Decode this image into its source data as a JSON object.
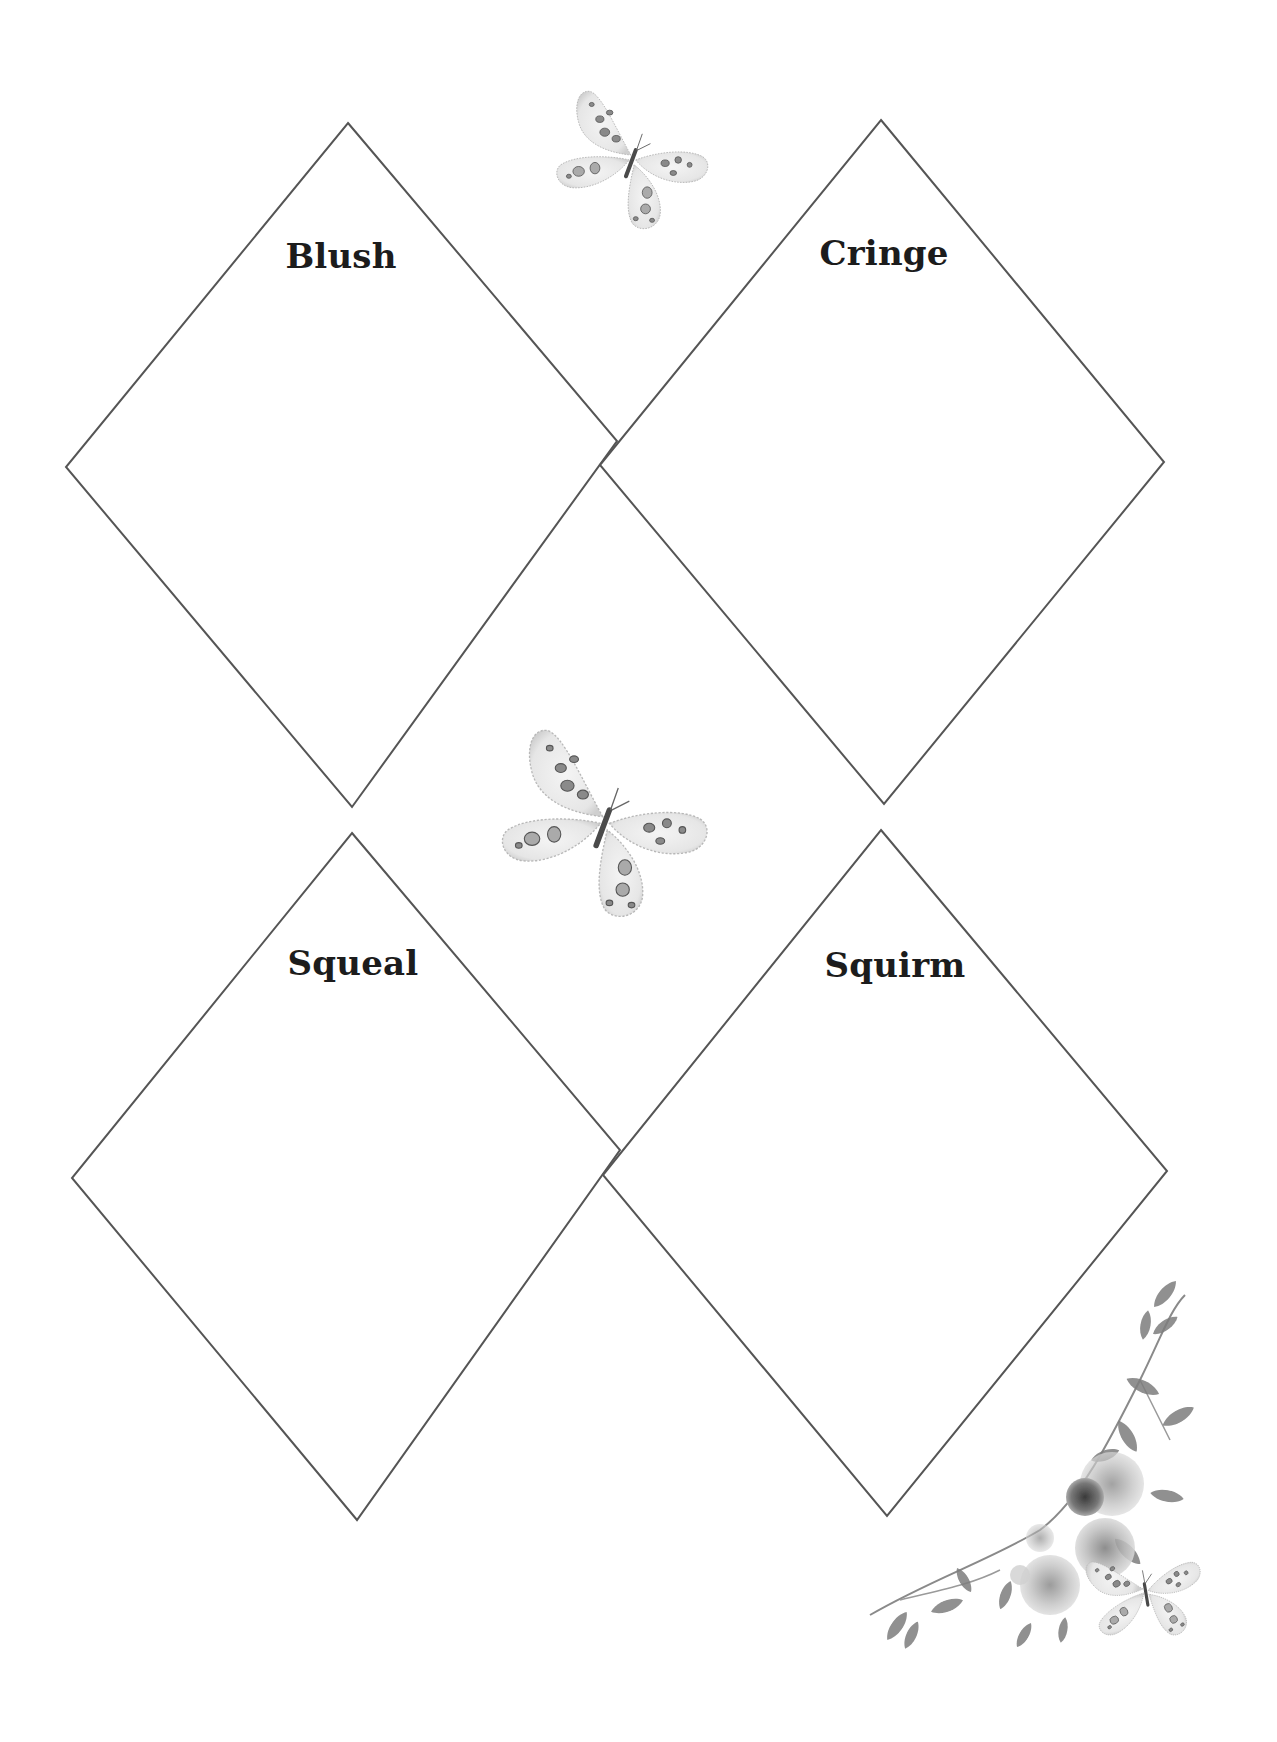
{
  "page": {
    "background": "#ffffff",
    "line_color": "#555555"
  },
  "diamonds": [
    {
      "label": "Blush",
      "top": [
        348,
        123
      ],
      "right": [
        617,
        441
      ],
      "bottom": [
        352,
        807
      ],
      "left": [
        66,
        467
      ],
      "label_pos": [
        341,
        258
      ]
    },
    {
      "label": "Cringe",
      "top": [
        881,
        120
      ],
      "right": [
        1164,
        462
      ],
      "bottom": [
        884,
        804
      ],
      "left": [
        600,
        465
      ],
      "label_pos": [
        884,
        255
      ]
    },
    {
      "label": "Squeal",
      "top": [
        352,
        833
      ],
      "right": [
        620,
        1150
      ],
      "bottom": [
        357,
        1520
      ],
      "left": [
        72,
        1178
      ],
      "label_pos": [
        353,
        965
      ]
    },
    {
      "label": "Squirm",
      "top": [
        881,
        830
      ],
      "right": [
        1167,
        1171
      ],
      "bottom": [
        887,
        1516
      ],
      "left": [
        603,
        1175
      ],
      "label_pos": [
        895,
        967
      ]
    }
  ],
  "decorations": {
    "butterfly_small": {
      "icon": "butterfly-icon",
      "x": 550,
      "y": 80,
      "w": 165,
      "h": 155
    },
    "butterfly_large": {
      "icon": "butterfly-icon",
      "x": 490,
      "y": 715,
      "w": 230,
      "h": 210
    },
    "floral_corner": {
      "icon": "floral-corner-icon",
      "x": 870,
      "y": 1290,
      "w": 340,
      "h": 360
    }
  }
}
